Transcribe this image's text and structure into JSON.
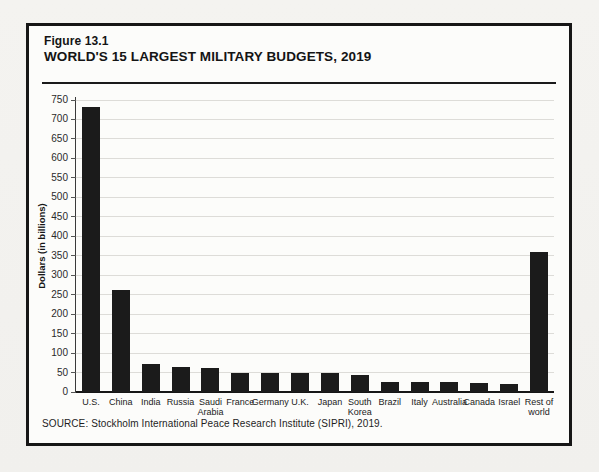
{
  "figure": {
    "number": "Figure 13.1",
    "title": "WORLD'S 15 LARGEST MILITARY BUDGETS, 2019",
    "source": "SOURCE: Stockholm International Peace Research Institute (SIPRI), 2019."
  },
  "chart_data": {
    "type": "bar",
    "title": "WORLD'S 15 LARGEST MILITARY BUDGETS, 2019",
    "categories": [
      "U.S.",
      "China",
      "India",
      "Russia",
      "Saudi Arabia",
      "France",
      "Germany",
      "U.K.",
      "Japan",
      "South Korea",
      "Brazil",
      "Italy",
      "Australia",
      "Canada",
      "Israel",
      "Rest of world"
    ],
    "values": [
      732,
      261,
      71,
      65,
      62,
      50,
      49,
      49,
      48,
      44,
      27,
      27,
      26,
      22,
      21,
      360
    ],
    "xlabel": "",
    "ylabel": "Dollars (in billions)",
    "ylim": [
      0,
      750
    ],
    "ytick_step": 50,
    "grid": true,
    "legend": "none",
    "bar_color": "#1b1b1b",
    "gridline_color": "#dddcd8"
  }
}
